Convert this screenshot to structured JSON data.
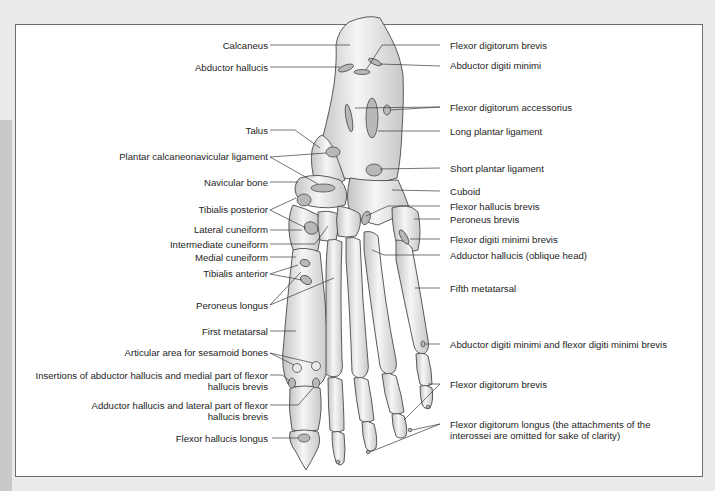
{
  "figure": {
    "colors": {
      "bone_fill": "#e6e6e6",
      "bone_highlight": "#f7f7f7",
      "bone_shadow": "#bdbdbd",
      "attachment_fill": "#b8b8b8",
      "outline": "#4a4a4a",
      "leader_line": "#3a3a3a",
      "label_text": "#1e1e1e",
      "frame_border": "#6d6d6d",
      "page_background": "#ebebeb"
    }
  },
  "labels_left": [
    {
      "id": "calcaneus",
      "text": "Calcaneus"
    },
    {
      "id": "abductor-hallucis",
      "text": "Abductor hallucis"
    },
    {
      "id": "talus",
      "text": "Talus"
    },
    {
      "id": "plantar-calcaneonavicular-ligament",
      "text": "Plantar calcaneonavicular ligament"
    },
    {
      "id": "navicular-bone",
      "text": "Navicular bone"
    },
    {
      "id": "tibialis-posterior",
      "text": "Tibialis posterior"
    },
    {
      "id": "lateral-cuneiform",
      "text": "Lateral cuneiform"
    },
    {
      "id": "intermediate-cuneiform",
      "text": "Intermediate cuneiform"
    },
    {
      "id": "medial-cuneiform",
      "text": "Medial cuneiform"
    },
    {
      "id": "tibialis-anterior",
      "text": "Tibialis anterior"
    },
    {
      "id": "peroneus-longus",
      "text": "Peroneus longus"
    },
    {
      "id": "first-metatarsal",
      "text": "First metatarsal"
    },
    {
      "id": "articular-area-sesamoid",
      "text": "Articular area for sesamoid bones"
    },
    {
      "id": "insertions-abductor-hallucis",
      "text": "Insertions of abductor hallucis and medial part of flexor hallucis brevis"
    },
    {
      "id": "adductor-hallucis-lateral",
      "text": "Adductor hallucis and lateral part of flexor hallucis brevis"
    },
    {
      "id": "flexor-hallucis-longus",
      "text": "Flexor hallucis longus"
    }
  ],
  "labels_right": [
    {
      "id": "flexor-digitorum-brevis-top",
      "text": "Flexor digitorum brevis"
    },
    {
      "id": "abductor-digiti-minimi",
      "text": "Abductor digiti minimi"
    },
    {
      "id": "flexor-digitorum-accessorius",
      "text": "Flexor digitorum accessorius"
    },
    {
      "id": "long-plantar-ligament",
      "text": "Long plantar ligament"
    },
    {
      "id": "short-plantar-ligament",
      "text": "Short plantar ligament"
    },
    {
      "id": "cuboid",
      "text": "Cuboid"
    },
    {
      "id": "flexor-hallucis-brevis",
      "text": "Flexor hallucis brevis"
    },
    {
      "id": "peroneus-brevis",
      "text": "Peroneus brevis"
    },
    {
      "id": "flexor-digiti-minimi-brevis",
      "text": "Flexor digiti minimi brevis"
    },
    {
      "id": "adductor-hallucis-oblique",
      "text": "Adductor hallucis (oblique head)"
    },
    {
      "id": "fifth-metatarsal",
      "text": "Fifth metatarsal"
    },
    {
      "id": "abductor-digiti-minimi-flexor",
      "text": "Abductor digiti minimi and flexor digiti minimi brevis"
    },
    {
      "id": "flexor-digitorum-brevis-bottom",
      "text": "Flexor digitorum brevis"
    },
    {
      "id": "flexor-digitorum-longus",
      "text": "Flexor digitorum longus (the attachments of the interossei are omitted for sake of clarity)"
    }
  ]
}
